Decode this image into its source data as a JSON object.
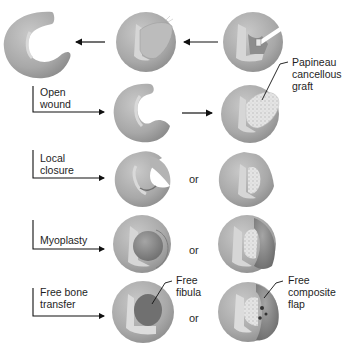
{
  "diagram": {
    "type": "surgical-procedure-flow",
    "colors": {
      "bone": "#a9a9a9",
      "bone_highlight": "#c8c8c8",
      "cortex_rim": "#d8d8d8",
      "graft": "#e6e6e6",
      "muscle_flap": "#8a8a8a",
      "fibula": "#6f6f6f",
      "arrow": "#111111"
    },
    "top_row": {
      "nodes": [
        {
          "id": "debrided-bone",
          "description": "bone after debridement (C-shaped defect)"
        },
        {
          "id": "infected-bone-sequestrum",
          "description": "bone with infected tissue / sequestrum"
        },
        {
          "id": "bone-with-drain",
          "description": "bone with sinus tract and drain"
        }
      ],
      "flow_direction": "right-to-left"
    },
    "rows": [
      {
        "label": "Open\nwound",
        "left_node": "open-wound-bone",
        "connector": "arrow",
        "right_node": "papineau-graft-bone",
        "right_annotation": "Papineau\ncancellous\ngraft"
      },
      {
        "label": "Local\nclosure",
        "left_node": "local-closure-bone",
        "connector": "or",
        "right_node": "local-closure-with-graft"
      },
      {
        "label": "Myoplasty",
        "left_node": "myoplasty-bone",
        "connector": "or",
        "right_node": "myoplasty-with-graft"
      },
      {
        "label": "Free bone\ntransfer",
        "left_node": "free-fibula-bone",
        "left_annotation": "Free\nfibula",
        "connector": "or",
        "right_node": "free-composite-flap-bone",
        "right_annotation": "Free\ncomposite\nflap"
      }
    ],
    "connector_word": "or"
  }
}
